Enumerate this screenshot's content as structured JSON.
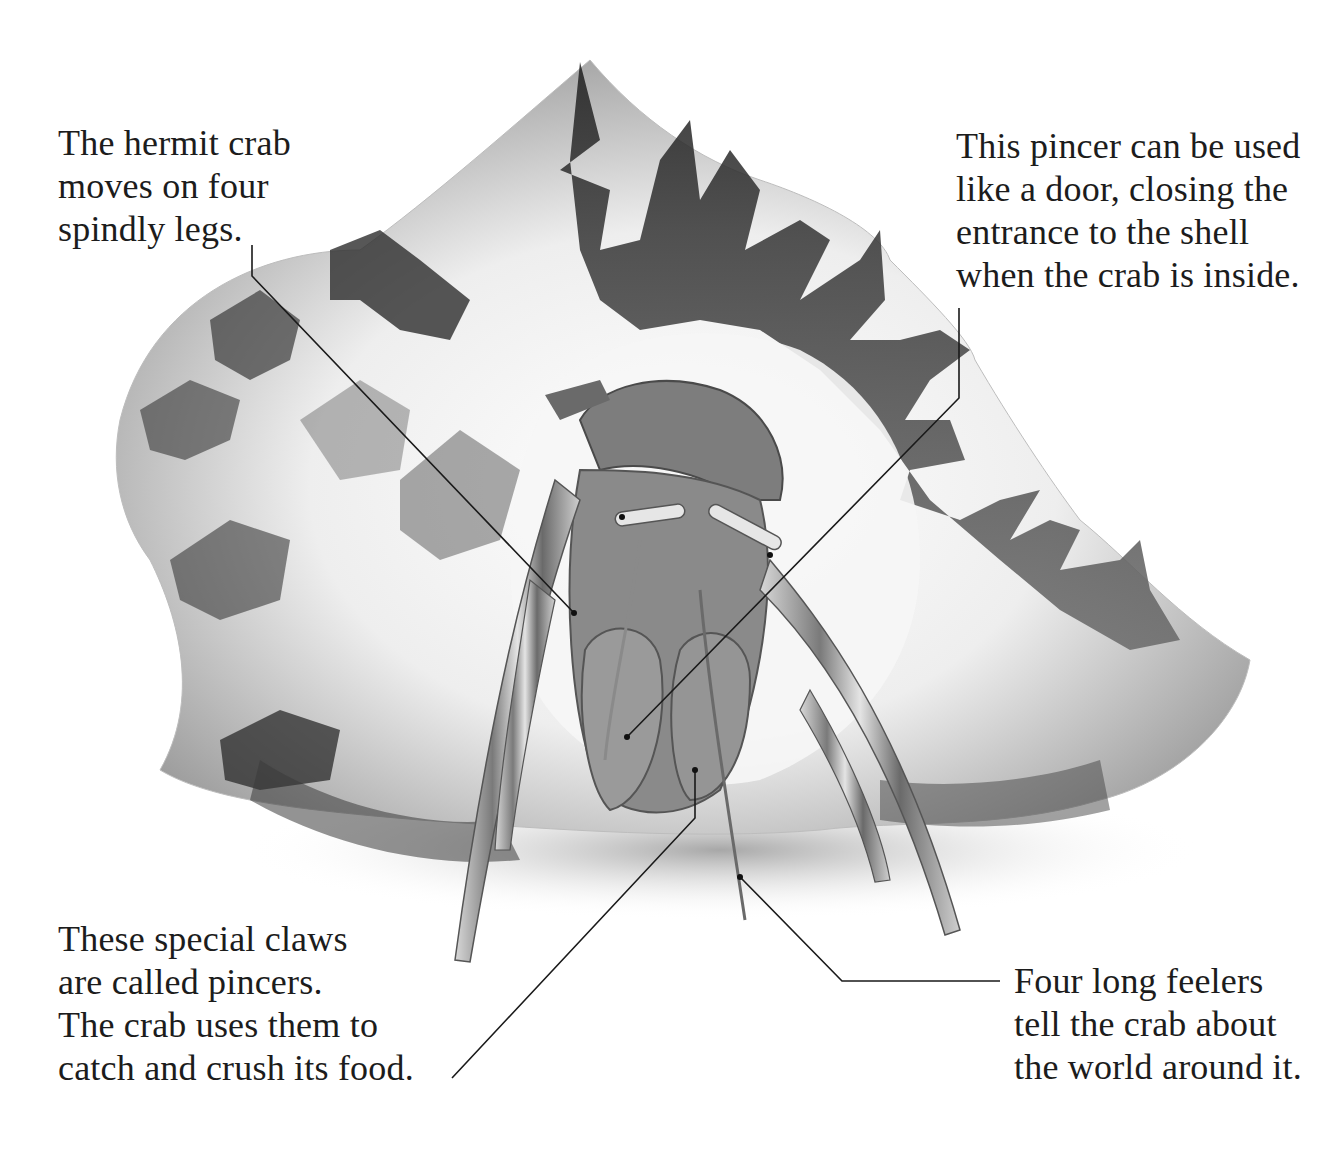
{
  "figure": {
    "colors": {
      "background": "#ffffff",
      "text": "#1c1c1c",
      "leader_line": "#1a1a1a",
      "shell_dark": "#2e2e2e",
      "shell_light": "#f2f2f2",
      "crab_body": "#7a7a7a"
    }
  },
  "labels": [
    {
      "id": "legs",
      "lines": [
        "The hermit crab",
        "moves on four",
        "spindly legs."
      ]
    },
    {
      "id": "door",
      "lines": [
        "This pincer can be used",
        "like a door, closing the",
        "entrance to the shell",
        "when the crab is inside."
      ]
    },
    {
      "id": "pincers",
      "lines": [
        "These special claws",
        "are called pincers.",
        "The crab uses them to",
        "catch and crush its food."
      ]
    },
    {
      "id": "feelers",
      "lines": [
        "Four long feelers",
        "tell the crab about",
        "the world around it."
      ]
    }
  ],
  "leader_lines": [
    {
      "label": "legs",
      "points": [
        [
          252,
          245
        ],
        [
          252,
          276
        ],
        [
          574,
          613
        ]
      ]
    },
    {
      "label": "door",
      "points": [
        [
          959,
          308
        ],
        [
          959,
          398
        ],
        [
          627,
          737
        ]
      ]
    },
    {
      "label": "pincers",
      "points": [
        [
          452,
          1078
        ],
        [
          695,
          818
        ],
        [
          695,
          770
        ]
      ]
    },
    {
      "label": "feelers",
      "points": [
        [
          1000,
          981
        ],
        [
          842,
          981
        ],
        [
          740,
          877
        ]
      ]
    }
  ]
}
